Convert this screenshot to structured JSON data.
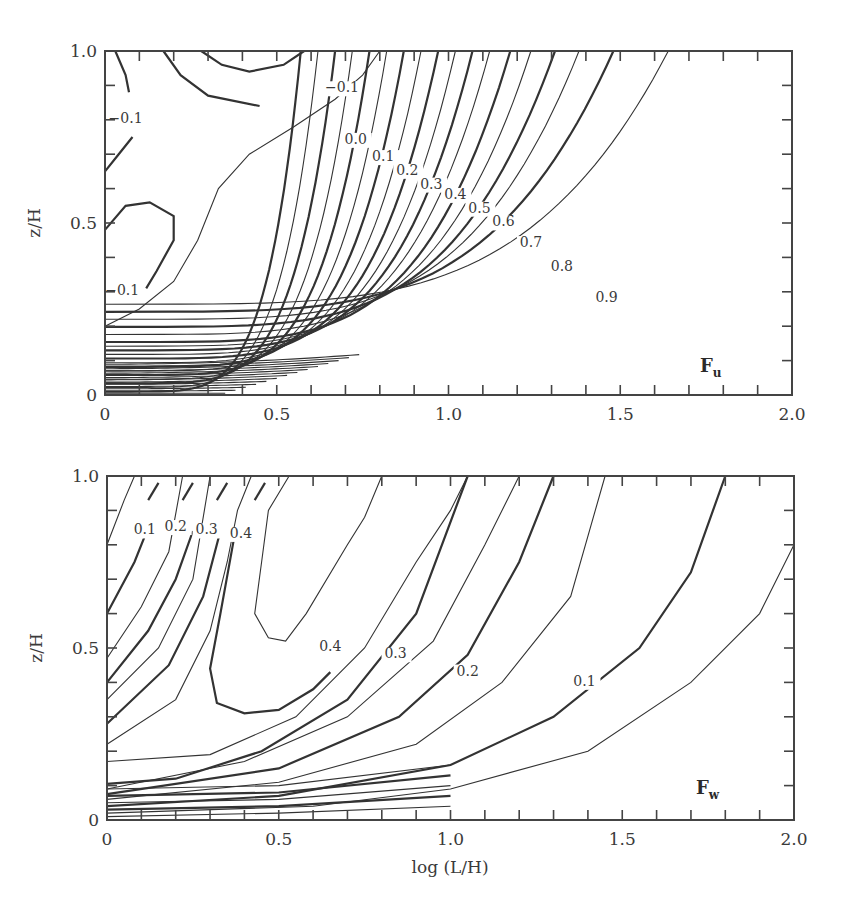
{
  "chart_data": [
    {
      "type": "contour",
      "panel_label": "F",
      "panel_label_sub": "u",
      "xlabel": "",
      "ylabel": "z/H",
      "xlim": [
        0,
        2.0
      ],
      "ylim": [
        0,
        1.0
      ],
      "xticks": [
        "0",
        "0.5",
        "1.0",
        "1.5",
        "2.0"
      ],
      "yticks": [
        "0",
        "0.5",
        "1.0"
      ],
      "minor_x_step": 0.1,
      "minor_y_step": 0.1,
      "grid": false,
      "contour_labels": [
        {
          "text": "−0.1",
          "x": 0.06,
          "z": 0.79
        },
        {
          "text": "−0.1",
          "x": 0.69,
          "z": 0.88
        },
        {
          "text": "0.0",
          "x": 0.73,
          "z": 0.73
        },
        {
          "text": "0.1",
          "x": 0.81,
          "z": 0.68
        },
        {
          "text": "0.2",
          "x": 0.88,
          "z": 0.64
        },
        {
          "text": "0.3",
          "x": 0.95,
          "z": 0.6
        },
        {
          "text": "0.4",
          "x": 1.02,
          "z": 0.57
        },
        {
          "text": "0.5",
          "x": 1.09,
          "z": 0.53
        },
        {
          "text": "0.6",
          "x": 1.16,
          "z": 0.49
        },
        {
          "text": "0.7",
          "x": 1.24,
          "z": 0.43
        },
        {
          "text": "0.8",
          "x": 1.33,
          "z": 0.36
        },
        {
          "text": "0.9",
          "x": 1.46,
          "z": 0.27
        },
        {
          "text": "−0.1",
          "x": 0.05,
          "z": 0.29
        }
      ],
      "levels": [
        -0.1,
        -0.05,
        0.0,
        0.05,
        0.1,
        0.15,
        0.2,
        0.25,
        0.3,
        0.35,
        0.4,
        0.45,
        0.5,
        0.55,
        0.6,
        0.65,
        0.7,
        0.75,
        0.8,
        0.85,
        0.9,
        0.95
      ]
    },
    {
      "type": "contour",
      "panel_label": "F",
      "panel_label_sub": "w",
      "xlabel": "log (L/H)",
      "ylabel": "z/H",
      "xlim": [
        0,
        2.0
      ],
      "ylim": [
        0,
        1.0
      ],
      "xticks": [
        "0",
        "0.5",
        "1.0",
        "1.5",
        "2.0"
      ],
      "yticks": [
        "0",
        "0.5",
        "1.0"
      ],
      "minor_x_step": 0.1,
      "minor_y_step": 0.1,
      "grid": false,
      "contour_labels": [
        {
          "text": "0.1",
          "x": 0.11,
          "z": 0.83
        },
        {
          "text": "0.2",
          "x": 0.2,
          "z": 0.84
        },
        {
          "text": "0.3",
          "x": 0.29,
          "z": 0.83
        },
        {
          "text": "0.4",
          "x": 0.39,
          "z": 0.82
        },
        {
          "text": "0.4",
          "x": 0.65,
          "z": 0.49
        },
        {
          "text": "0.3",
          "x": 0.84,
          "z": 0.47
        },
        {
          "text": "0.2",
          "x": 1.05,
          "z": 0.42
        },
        {
          "text": "0.1",
          "x": 1.39,
          "z": 0.39
        }
      ],
      "levels": [
        0.05,
        0.1,
        0.15,
        0.2,
        0.25,
        0.3,
        0.35,
        0.4,
        0.45
      ]
    }
  ],
  "ui": {
    "top": {
      "ylabel": "z/H",
      "panel": "F",
      "panel_sub": "u"
    },
    "bottom": {
      "ylabel": "z/H",
      "xlabel": "log (L/H)",
      "panel": "F",
      "panel_sub": "w"
    }
  }
}
